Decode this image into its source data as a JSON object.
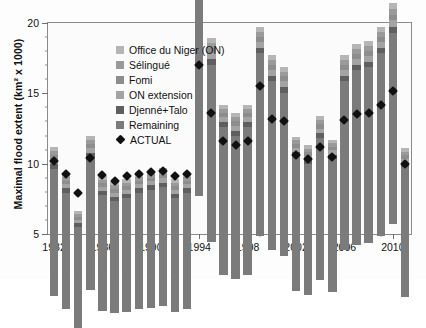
{
  "chart_data": {
    "type": "bar",
    "stacked": true,
    "title": "",
    "xlabel": "",
    "ylabel": "Maximal flood extent (km² x 1000)",
    "ylim": [
      5,
      20
    ],
    "yticks": [
      5,
      10,
      15,
      20
    ],
    "ytick_labels": [
      "5",
      "10",
      "15",
      "20"
    ],
    "y_minor_step": 1,
    "grid": false,
    "legend_position": "upper-left-inside",
    "xtick_labels": [
      "1982",
      "1986",
      "1990",
      "1994",
      "1998",
      "2002",
      "2006",
      "2010"
    ],
    "categories": [
      "1982",
      "1983",
      "1984",
      "1985",
      "1986",
      "1987",
      "1988",
      "1989",
      "1990",
      "1991",
      "1992",
      "1993",
      "1994",
      "1995",
      "1996",
      "1997",
      "1998",
      "1999",
      "2000",
      "2001",
      "2002",
      "2003",
      "2004",
      "2005",
      "2006",
      "2007",
      "2008",
      "2009",
      "2010",
      "2011"
    ],
    "series": [
      {
        "name": "Remaining",
        "color": "#7b7b7b",
        "values": [
          9.0,
          8.3,
          7.2,
          9.4,
          8.2,
          8.0,
          8.1,
          8.3,
          8.4,
          8.5,
          8.1,
          8.3,
          15.6,
          12.6,
          10.5,
          10.2,
          10.5,
          13.0,
          12.0,
          11.6,
          9.6,
          9.3,
          10.1,
          9.5,
          12.0,
          12.4,
          12.5,
          13.0,
          13.6,
          9.2
        ]
      },
      {
        "name": "Djenné+Talo",
        "color": "#5f5f5f",
        "values": [
          0.35,
          0.3,
          0.25,
          0.35,
          0.3,
          0.3,
          0.3,
          0.3,
          0.3,
          0.3,
          0.3,
          0.3,
          0.45,
          0.4,
          0.35,
          0.35,
          0.35,
          0.4,
          0.4,
          0.4,
          0.3,
          0.3,
          0.35,
          0.3,
          0.4,
          0.4,
          0.4,
          0.4,
          0.45,
          0.3
        ]
      },
      {
        "name": "ON extension",
        "color": "#a3a3a3",
        "values": [
          0.35,
          0.3,
          0.25,
          0.35,
          0.3,
          0.3,
          0.3,
          0.3,
          0.3,
          0.3,
          0.3,
          0.3,
          0.45,
          0.4,
          0.35,
          0.35,
          0.35,
          0.4,
          0.4,
          0.4,
          0.3,
          0.3,
          0.35,
          0.3,
          0.4,
          0.4,
          0.4,
          0.4,
          0.45,
          0.3
        ]
      },
      {
        "name": "Fomi",
        "color": "#8d8d8d",
        "values": [
          0.3,
          0.25,
          0.2,
          0.3,
          0.25,
          0.25,
          0.25,
          0.25,
          0.25,
          0.25,
          0.25,
          0.25,
          0.4,
          0.35,
          0.3,
          0.3,
          0.3,
          0.35,
          0.35,
          0.35,
          0.25,
          0.25,
          0.3,
          0.25,
          0.35,
          0.35,
          0.35,
          0.35,
          0.4,
          0.25
        ]
      },
      {
        "name": "Sélingué",
        "color": "#9a9a9a",
        "values": [
          0.3,
          0.25,
          0.2,
          0.3,
          0.25,
          0.25,
          0.25,
          0.25,
          0.25,
          0.25,
          0.25,
          0.25,
          0.4,
          0.35,
          0.3,
          0.3,
          0.3,
          0.35,
          0.35,
          0.35,
          0.25,
          0.25,
          0.3,
          0.25,
          0.35,
          0.35,
          0.35,
          0.35,
          0.4,
          0.25
        ]
      },
      {
        "name": "Office du Niger (ON)",
        "color": "#b5b5b5",
        "values": [
          0.3,
          0.25,
          0.2,
          0.3,
          0.25,
          0.25,
          0.25,
          0.25,
          0.25,
          0.25,
          0.25,
          0.25,
          0.4,
          0.35,
          0.3,
          0.3,
          0.3,
          0.35,
          0.35,
          0.35,
          0.25,
          0.25,
          0.3,
          0.25,
          0.35,
          0.35,
          0.35,
          0.35,
          0.4,
          0.25
        ]
      }
    ],
    "actual": {
      "name": "ACTUAL",
      "marker": "diamond",
      "color": "#111111",
      "values": [
        10.2,
        9.3,
        7.9,
        10.4,
        9.2,
        8.8,
        9.1,
        9.3,
        9.4,
        9.5,
        9.1,
        9.3,
        17.0,
        13.6,
        11.6,
        11.3,
        11.6,
        15.5,
        13.2,
        13.0,
        10.6,
        10.3,
        11.2,
        10.5,
        13.1,
        13.5,
        13.6,
        14.2,
        15.2,
        10.0
      ]
    },
    "legend": [
      {
        "label": "Office du Niger (ON)",
        "swatch": "#b5b5b5",
        "type": "square"
      },
      {
        "label": "Sélingué",
        "swatch": "#9a9a9a",
        "type": "square"
      },
      {
        "label": "Fomi",
        "swatch": "#8d8d8d",
        "type": "square"
      },
      {
        "label": "ON extension",
        "swatch": "#a3a3a3",
        "type": "square"
      },
      {
        "label": "Djenné+Talo",
        "swatch": "#5f5f5f",
        "type": "square"
      },
      {
        "label": "Remaining",
        "swatch": "#7b7b7b",
        "type": "square"
      },
      {
        "label": "ACTUAL",
        "swatch": "#111111",
        "type": "diamond"
      }
    ]
  }
}
